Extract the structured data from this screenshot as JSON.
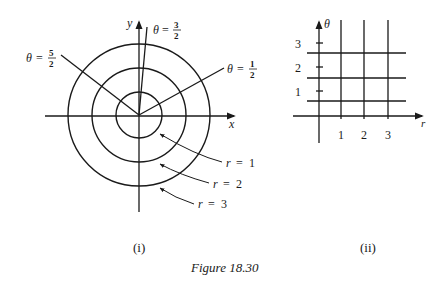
{
  "figure": {
    "caption": "Figure 18.30",
    "panels": [
      {
        "id": "i",
        "label": "(i)",
        "type": "polar-plane",
        "axes": {
          "x_label": "x",
          "y_label": "y"
        },
        "circles": [
          {
            "label": "r = 1",
            "r_var": "r",
            "r_val": "1"
          },
          {
            "label": "r = 2",
            "r_var": "r",
            "r_val": "2"
          },
          {
            "label": "r = 3",
            "r_var": "r",
            "r_val": "3"
          }
        ],
        "rays": [
          {
            "label": "θ = 1/2",
            "var": "θ",
            "num": "1",
            "den": "2"
          },
          {
            "label": "θ = 3/2",
            "var": "θ",
            "num": "3",
            "den": "2"
          },
          {
            "label": "θ = 5/2",
            "var": "θ",
            "num": "5",
            "den": "2"
          }
        ]
      },
      {
        "id": "ii",
        "label": "(ii)",
        "type": "r-theta-grid",
        "axes": {
          "x_label": "r",
          "y_label": "θ"
        },
        "x_ticks": [
          "1",
          "2",
          "3"
        ],
        "y_ticks": [
          "1",
          "2",
          "3"
        ]
      }
    ]
  }
}
